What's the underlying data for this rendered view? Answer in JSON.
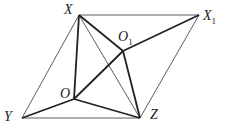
{
  "points": {
    "X": {
      "label": "X",
      "x": 79,
      "y": 15
    },
    "X1": {
      "label": "X",
      "sub": "1",
      "x": 199,
      "y": 15
    },
    "O1": {
      "label": "O",
      "sub": "1",
      "x": 123,
      "y": 51
    },
    "O": {
      "label": "O",
      "x": 74,
      "y": 99
    },
    "Y": {
      "label": "Y",
      "x": 22,
      "y": 118
    },
    "Z": {
      "label": "Z",
      "x": 140,
      "y": 118
    }
  },
  "thin_segments": [
    [
      "X",
      "X1"
    ],
    [
      "X1",
      "Z"
    ],
    [
      "X",
      "Y"
    ],
    [
      "Y",
      "Z"
    ],
    [
      "X",
      "Z"
    ]
  ],
  "thick_segments": [
    [
      "X",
      "O"
    ],
    [
      "X",
      "O1"
    ],
    [
      "O1",
      "Z"
    ],
    [
      "O",
      "O1"
    ],
    [
      "O1",
      "X1"
    ],
    [
      "O",
      "Y"
    ],
    [
      "O",
      "Z"
    ]
  ],
  "colors": {
    "line": "#222222",
    "background": "#ffffff"
  }
}
